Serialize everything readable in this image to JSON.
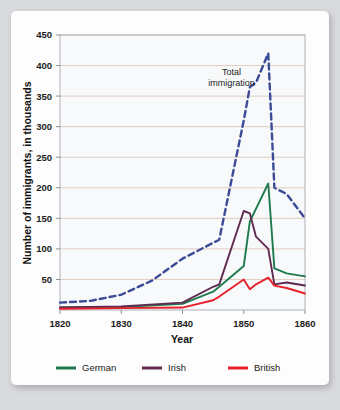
{
  "chart_data": {
    "type": "line",
    "title": "",
    "xlabel": "Year",
    "ylabel": "Number of immigrants, in thousands",
    "xlim": [
      1820,
      1860
    ],
    "ylim": [
      0,
      450
    ],
    "xticks": [
      1820,
      1830,
      1840,
      1850,
      1860
    ],
    "yticks": [
      0,
      50,
      100,
      150,
      200,
      250,
      300,
      350,
      400,
      450
    ],
    "ytick_labels": [
      "50",
      "100",
      "150",
      "200",
      "250",
      "300",
      "350",
      "400",
      "450"
    ],
    "grid": true,
    "legend_position": "bottom",
    "annotations": [
      {
        "text_line1": "Total",
        "text_line2": "immigration",
        "x": 1848,
        "y": 385
      }
    ],
    "series": [
      {
        "name": "Total immigration",
        "color": "#3b4b95",
        "style": "dashed",
        "in_legend": false,
        "x": [
          1820,
          1825,
          1830,
          1835,
          1840,
          1845,
          1846,
          1850,
          1851,
          1852,
          1854,
          1855,
          1857,
          1860
        ],
        "values": [
          12,
          15,
          25,
          48,
          84,
          110,
          115,
          310,
          365,
          372,
          420,
          200,
          190,
          150
        ]
      },
      {
        "name": "German",
        "color": "#1f7a4d",
        "style": "solid",
        "in_legend": true,
        "x": [
          1820,
          1830,
          1840,
          1845,
          1846,
          1850,
          1851,
          1854,
          1855,
          1857,
          1860
        ],
        "values": [
          4,
          5,
          10,
          30,
          38,
          72,
          145,
          207,
          68,
          60,
          55
        ]
      },
      {
        "name": "Irish",
        "color": "#5e2a4e",
        "style": "solid",
        "in_legend": true,
        "x": [
          1820,
          1830,
          1840,
          1845,
          1846,
          1850,
          1851,
          1852,
          1854,
          1855,
          1857,
          1860
        ],
        "values": [
          4,
          6,
          12,
          38,
          42,
          162,
          158,
          120,
          100,
          42,
          45,
          40
        ]
      },
      {
        "name": "British",
        "color": "#e8202a",
        "style": "solid",
        "in_legend": true,
        "x": [
          1820,
          1830,
          1840,
          1845,
          1846,
          1850,
          1851,
          1852,
          1854,
          1855,
          1857,
          1860
        ],
        "values": [
          2,
          3,
          4,
          16,
          22,
          50,
          34,
          42,
          53,
          40,
          36,
          27
        ]
      }
    ],
    "legend": [
      {
        "label": "German",
        "color": "#1f7a4d"
      },
      {
        "label": "Irish",
        "color": "#5e2a4e"
      },
      {
        "label": "British",
        "color": "#e8202a"
      }
    ]
  }
}
